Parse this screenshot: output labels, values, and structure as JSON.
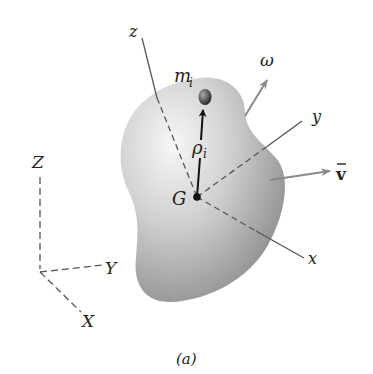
{
  "figure": {
    "caption": "(a)",
    "body": {
      "center_label": "G",
      "particle_label": "m",
      "particle_subscript": "i",
      "position_vector_label": "ρ",
      "position_vector_subscript": "i"
    },
    "body_axes": {
      "x": "x",
      "y": "y",
      "z": "z"
    },
    "vectors": {
      "angular_velocity": "ω",
      "velocity": "v",
      "velocity_bar": "‾"
    },
    "fixed_axes": {
      "X": "X",
      "Y": "Y",
      "Z": "Z"
    },
    "colors": {
      "line": "#555555",
      "arrow": "#8a8a8a",
      "text": "#222222",
      "body_light": "#f2f2f2",
      "body_dark": "#8e8e8e"
    }
  }
}
